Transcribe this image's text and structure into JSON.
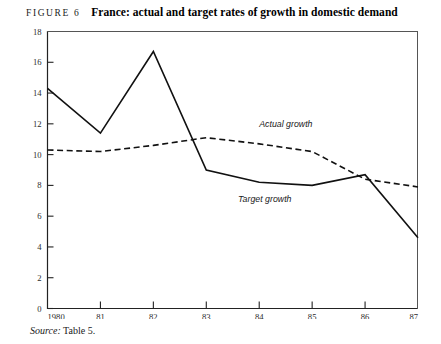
{
  "figure": {
    "label": "FIGURE 6",
    "title": "France: actual and target rates of growth in domestic demand",
    "source_word": "Source:",
    "source_text": "Table 5."
  },
  "chart_data": {
    "type": "line",
    "title": "France: actual and target rates of growth in domestic demand",
    "xlabel": "",
    "ylabel": "",
    "x": [
      1980,
      1981,
      1982,
      1983,
      1984,
      1985,
      1986,
      1987
    ],
    "categories": [
      "1980",
      "81",
      "82",
      "83",
      "84",
      "85",
      "86",
      "87"
    ],
    "xtick_labels": [
      "1980",
      "81",
      "82",
      "83",
      "84",
      "85",
      "86",
      "87"
    ],
    "ytick_labels": [
      "0",
      "2",
      "4",
      "6",
      "8",
      "10",
      "12",
      "14",
      "16",
      "18"
    ],
    "yticks": [
      0,
      2,
      4,
      6,
      8,
      10,
      12,
      14,
      16,
      18
    ],
    "ylim": [
      0,
      18
    ],
    "xlim": [
      1980,
      1987
    ],
    "grid": false,
    "legend": "inline-annotations",
    "series": [
      {
        "name": "Target growth",
        "style": "solid",
        "color": "#111111",
        "label_text": "Target growth",
        "values": [
          14.3,
          11.4,
          16.7,
          9.0,
          8.2,
          8.0,
          8.7,
          4.6
        ]
      },
      {
        "name": "Actual growth",
        "style": "dashed",
        "color": "#111111",
        "label_text": "Actual growth",
        "values": [
          10.3,
          10.2,
          10.6,
          11.1,
          10.7,
          10.2,
          8.4,
          7.9
        ]
      }
    ],
    "annotations": [
      {
        "text": "Actual growth",
        "x": 1984.0,
        "y": 11.8
      },
      {
        "text": "Target growth",
        "x": 1983.6,
        "y": 6.9
      }
    ]
  }
}
